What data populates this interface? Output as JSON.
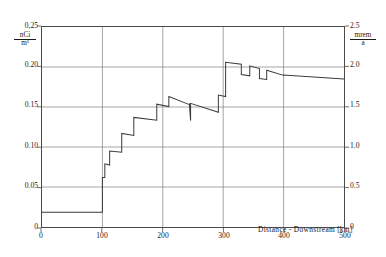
{
  "chart_data": {
    "type": "line",
    "title": "",
    "subtitle": "",
    "xlabel": "Distance - Downstream",
    "xunit": "km",
    "xlim": [
      0,
      500
    ],
    "xticks": [
      0,
      100,
      200,
      300,
      400,
      500
    ],
    "xticklabels": [
      "0",
      "100",
      "200",
      "300",
      "400",
      "500"
    ],
    "ylabel_left": "nCi/m³",
    "ylabel_left_num": "nCi",
    "ylabel_left_den": "m³",
    "ylim_left": [
      0,
      0.25
    ],
    "yticks_left": [
      0,
      0.05,
      0.1,
      0.15,
      0.2,
      0.25
    ],
    "yticklabels_left": [
      "0",
      "0.05",
      "0.10",
      "0.15",
      "0.20",
      "0,25"
    ],
    "ylabel_right": "mrem/a",
    "ylabel_right_num": "mrem",
    "ylabel_right_den": "a",
    "ylim_right": [
      0,
      2.5
    ],
    "yticks_right": [
      0,
      0.5,
      1.0,
      1.5,
      2.0,
      2.5
    ],
    "yticklabels_right": [
      "0",
      "0.5",
      "1.0",
      "1.5",
      "2.0",
      "2.5"
    ],
    "grid": true,
    "legend": "none",
    "series": [
      {
        "name": "concentration",
        "style": "step-decay",
        "color": "#3a3a3a",
        "points": [
          [
            0,
            0.0185
          ],
          [
            100,
            0.0185
          ],
          [
            100,
            0.062
          ],
          [
            104,
            0.062
          ],
          [
            104,
            0.079
          ],
          [
            112,
            0.0775
          ],
          [
            112,
            0.095
          ],
          [
            132,
            0.0935
          ],
          [
            132,
            0.117
          ],
          [
            152,
            0.1145
          ],
          [
            152,
            0.137
          ],
          [
            190,
            0.1335
          ],
          [
            190,
            0.1535
          ],
          [
            210,
            0.1505
          ],
          [
            210,
            0.163
          ],
          [
            244,
            0.153
          ],
          [
            244,
            0.1545
          ],
          [
            246,
            0.133
          ],
          [
            246,
            0.1545
          ],
          [
            292,
            0.1435
          ],
          [
            292,
            0.165
          ],
          [
            304,
            0.163
          ],
          [
            304,
            0.206
          ],
          [
            330,
            0.2035
          ],
          [
            330,
            0.1905
          ],
          [
            344,
            0.189
          ],
          [
            344,
            0.2015
          ],
          [
            360,
            0.198
          ],
          [
            360,
            0.1855
          ],
          [
            372,
            0.1845
          ],
          [
            372,
            0.196
          ],
          [
            400,
            0.1895
          ],
          [
            400,
            0.19
          ],
          [
            500,
            0.185
          ]
        ]
      }
    ]
  },
  "axes": {
    "x_caption": "Distance - Downstream",
    "x_unit_open": "[",
    "x_unit_text": "km",
    "x_unit_close": "]"
  }
}
